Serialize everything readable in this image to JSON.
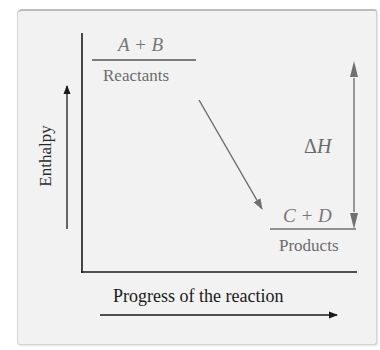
{
  "figure": {
    "y_axis_label": "Enthalpy",
    "x_axis_label": "Progress of the reaction",
    "reactants": {
      "formula": "A + B",
      "label": "Reactants"
    },
    "products": {
      "formula": "C + D",
      "label": "Products"
    },
    "delta_h": {
      "symbol": "Δ",
      "variable": "H"
    },
    "colors": {
      "panel_background": "#f2f2f2",
      "axis_lines": "#1a1a1a",
      "annotation_gray": "#6e6e6e"
    }
  }
}
